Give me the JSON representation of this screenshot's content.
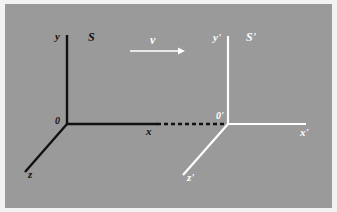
{
  "figure": {
    "background_color": "#9a9a9a",
    "border_color": "#f2f2f2",
    "frame_s_color": "#111111",
    "frame_s_prime_color": "#ffffff"
  },
  "frame_s": {
    "name_label": "S",
    "origin_label": "0",
    "axes": [
      {
        "label": "y",
        "orientation": "vertical-up"
      },
      {
        "label": "x",
        "orientation": "horizontal-right"
      },
      {
        "label": "z",
        "orientation": "diagonal-down-left"
      }
    ]
  },
  "frame_s_prime": {
    "name_label": "S'",
    "origin_label": "0'",
    "axes": [
      {
        "label": "y'",
        "orientation": "vertical-up"
      },
      {
        "label": "x'",
        "orientation": "horizontal-right"
      },
      {
        "label": "z'",
        "orientation": "diagonal-down-left"
      }
    ]
  },
  "velocity": {
    "label": "v",
    "direction": "right"
  },
  "connector": {
    "style": "dashed",
    "color": "#111111"
  }
}
